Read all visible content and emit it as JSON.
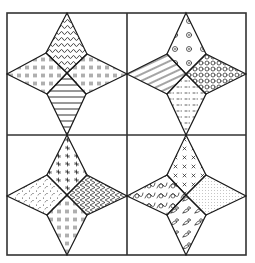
{
  "figure": {
    "colors": {
      "line": "#1a1a1a",
      "frame": "#333333",
      "background": "#ffffff"
    }
  },
  "frame": {
    "x": 7,
    "y": 13,
    "width": 239,
    "height": 242,
    "divider_x": 127,
    "divider_y": 135
  },
  "blocks": [
    {
      "id": "top-left",
      "center": [
        67,
        73
      ],
      "tips": {
        "top": [
          67,
          13
        ],
        "right": [
          127,
          74
        ],
        "bottom": [
          67,
          135
        ],
        "left": [
          7,
          74
        ]
      },
      "inner": {
        "upper_left": [
          46,
          53
        ],
        "upper_right": [
          87,
          54
        ],
        "lower_right": [
          86,
          94
        ],
        "lower_left": [
          47,
          94
        ]
      },
      "patches": [
        {
          "position": "top",
          "pattern": "wavy-vertical-stripes"
        },
        {
          "position": "right",
          "pattern": "small-tick-marks"
        },
        {
          "position": "bottom",
          "pattern": "horizontal-stripes"
        },
        {
          "position": "left",
          "pattern": "small-tick-marks"
        }
      ]
    },
    {
      "id": "top-right",
      "center": [
        186,
        74
      ],
      "tips": {
        "top": [
          186,
          13
        ],
        "right": [
          246,
          74
        ],
        "bottom": [
          186,
          135
        ],
        "left": [
          127,
          74
        ]
      },
      "inner": {
        "upper_left": [
          167,
          54
        ],
        "upper_right": [
          206,
          54
        ],
        "lower_right": [
          206,
          94
        ],
        "lower_left": [
          167,
          94
        ]
      },
      "patches": [
        {
          "position": "top",
          "pattern": "scattered-flowers"
        },
        {
          "position": "right",
          "pattern": "dense-circles"
        },
        {
          "position": "bottom",
          "pattern": "dash-dots"
        },
        {
          "position": "left",
          "pattern": "diagonal-stripes"
        }
      ]
    },
    {
      "id": "bottom-left",
      "center": [
        67,
        195
      ],
      "tips": {
        "top": [
          67,
          135
        ],
        "right": [
          127,
          196
        ],
        "bottom": [
          67,
          255
        ],
        "left": [
          7,
          196
        ]
      },
      "inner": {
        "upper_left": [
          47,
          175
        ],
        "upper_right": [
          87,
          175
        ],
        "lower_right": [
          87,
          215
        ],
        "lower_left": [
          47,
          215
        ]
      },
      "patches": [
        {
          "position": "top",
          "pattern": "small-stars"
        },
        {
          "position": "right",
          "pattern": "zigzag"
        },
        {
          "position": "bottom",
          "pattern": "small-tick-marks"
        },
        {
          "position": "left",
          "pattern": "speckles"
        }
      ]
    },
    {
      "id": "bottom-right",
      "center": [
        186,
        195
      ],
      "tips": {
        "top": [
          186,
          135
        ],
        "right": [
          246,
          196
        ],
        "bottom": [
          186,
          255
        ],
        "left": [
          127,
          196
        ]
      },
      "inner": {
        "upper_left": [
          167,
          175
        ],
        "upper_right": [
          206,
          175
        ],
        "lower_right": [
          206,
          215
        ],
        "lower_left": [
          167,
          215
        ]
      },
      "patches": [
        {
          "position": "top",
          "pattern": "x-marks"
        },
        {
          "position": "right",
          "pattern": "fine-dots"
        },
        {
          "position": "bottom",
          "pattern": "floral-sprigs"
        },
        {
          "position": "left",
          "pattern": "loops"
        }
      ]
    }
  ]
}
